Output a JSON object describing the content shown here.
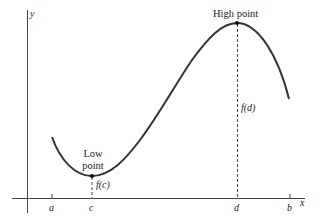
{
  "figure": {
    "title": "",
    "axes": {
      "x_label": "x",
      "y_label": "y"
    },
    "ticks": [
      {
        "label": "a",
        "x": 52
      },
      {
        "label": "c",
        "x": 92
      },
      {
        "label": "d",
        "x": 237
      },
      {
        "label": "b",
        "x": 290
      }
    ],
    "points": {
      "low": {
        "label_line1": "Low",
        "label_line2": "point",
        "value_label": "f(c)"
      },
      "high": {
        "label": "High point",
        "value_label": "f(d)"
      }
    },
    "colors": {
      "curve": "#333333",
      "axis": "#444444",
      "text": "#222222",
      "background": "#ffffff"
    }
  }
}
